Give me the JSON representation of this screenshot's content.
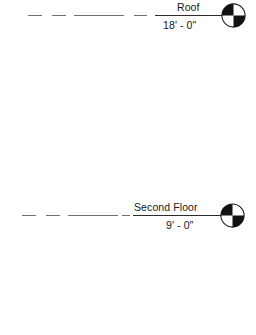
{
  "drawing": {
    "type": "architectural-level-datums",
    "background_color": "#ffffff",
    "line_color": "#2b2b2b",
    "lead_line_color": "#6f6f6f",
    "text_color": "#171717",
    "levels": [
      {
        "name": "Roof",
        "elevation": "18' - 0\"",
        "head_symbol": "quartered-circle",
        "y": 15
      },
      {
        "name": "Second Floor",
        "elevation": "9' - 0\"",
        "head_symbol": "quartered-circle",
        "y": 215
      }
    ]
  }
}
